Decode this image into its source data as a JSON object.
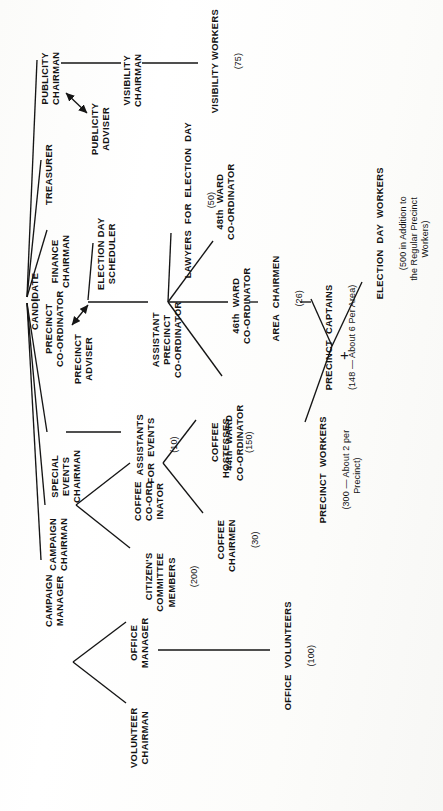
{
  "document": {
    "type": "organization-chart",
    "orientation": "rotated-90-ccw",
    "title": "Campaign Organization Chart",
    "ink_color": "#121212",
    "paper_color": "#fdfdfb"
  },
  "nodes": {
    "candidate": {
      "label": "CANDIDATE"
    },
    "campaign_manager": {
      "label": "CAMPAIGN\nMANAGER"
    },
    "campaign_chairman": {
      "label": "CAMPAIGN\nCHAIRMAN"
    },
    "special_events_chairman": {
      "label": "SPECIAL\nEVENTS\nCHAIRMAN"
    },
    "precinct_coordinator": {
      "label": "PRECINCT\nCO-ORDINATOR"
    },
    "finance_chairman": {
      "label": "FINANCE\nCHAIRMAN"
    },
    "treasurer": {
      "label": "TREASURER"
    },
    "publicity_chairman": {
      "label": "PUBLICITY\nCHAIRMAN"
    },
    "publicity_adviser": {
      "label": "PUBLICITY\nADVISER"
    },
    "visibility_chairman": {
      "label": "VISIBILITY\nCHAIRMAN"
    },
    "visibility_workers": {
      "label": "VISIBILITY WORKERS",
      "count": "(75)"
    },
    "election_day_scheduler": {
      "label": "ELECTION DAY\nSCHEDULER"
    },
    "precinct_adviser": {
      "label": "PRECINCT\nADVISER"
    },
    "assistant_precinct_coordinator": {
      "label": "ASSISTANT\nPRECINCT\nCO-ORDINATOR"
    },
    "lawyers_for_election_day": {
      "label": "LAWYERS  FOR  ELECTION  DAY",
      "count": "(50)"
    },
    "ward_48": {
      "label": "48th  WARD\nCO-ORDINATOR"
    },
    "ward_46": {
      "label": "46th  WARD\nCO-ORDINATOR"
    },
    "ward_44": {
      "label": "44th  WARD\nCO-ORDINATOR"
    },
    "area_chairmen": {
      "label": "AREA  CHAIRMEN",
      "count": "(26)"
    },
    "precinct_captains": {
      "label": "PRECINCT  CAPTAINS",
      "count": "(148 — About 6 Per Area)"
    },
    "precinct_workers": {
      "label": "PRECINCT  WORKERS",
      "count": "(300 — About 2 per\nPrecinct)"
    },
    "election_day_workers": {
      "label": "ELECTION  DAY  WORKERS",
      "count": "(500 in Addition to\nthe Regular Precinct\nWorkers)"
    },
    "assistants_for_events": {
      "label": "ASSISTANTS\nFOR  EVENTS",
      "count": "(10)"
    },
    "citizens_committee_members": {
      "label": "CITIZEN'S\nCOMMITTEE\nMEMBERS",
      "count": "(200)"
    },
    "coffee_coordinator": {
      "label": "COFFEE\nCO-ORD\nINATOR"
    },
    "coffee_chairmen": {
      "label": "COFFEE\nCHAIRMEN",
      "count": "(30)"
    },
    "coffee_hostesses": {
      "label": "COFFEE\nHOSTESSES",
      "count": "(150)"
    },
    "volunteer_chairman": {
      "label": "VOLUNTEER\nCHAIRMAN"
    },
    "office_manager": {
      "label": "OFFICE\nMANAGER"
    },
    "office_volunteers": {
      "label": "OFFICE  VOLUNTEERS",
      "count": "(100)"
    }
  },
  "symbols": {
    "plus": "+"
  },
  "edges": [
    {
      "from": "candidate",
      "to": "campaign_manager",
      "style": "line"
    },
    {
      "from": "candidate",
      "to": "campaign_chairman",
      "style": "line"
    },
    {
      "from": "candidate",
      "to": "special_events_chairman",
      "style": "line"
    },
    {
      "from": "candidate",
      "to": "precinct_coordinator",
      "style": "tick"
    },
    {
      "from": "candidate",
      "to": "finance_chairman",
      "style": "line"
    },
    {
      "from": "candidate",
      "to": "treasurer",
      "style": "line"
    },
    {
      "from": "candidate",
      "to": "publicity_chairman",
      "style": "line"
    },
    {
      "from": "publicity_chairman",
      "to": "publicity_adviser",
      "style": "double-arrow"
    },
    {
      "from": "publicity_chairman",
      "to": "visibility_chairman",
      "style": "line"
    },
    {
      "from": "visibility_chairman",
      "to": "visibility_workers",
      "style": "line"
    },
    {
      "from": "precinct_coordinator",
      "to": "election_day_scheduler",
      "style": "line"
    },
    {
      "from": "precinct_coordinator",
      "to": "precinct_adviser",
      "style": "double-arrow"
    },
    {
      "from": "precinct_coordinator",
      "to": "assistant_precinct_coordinator",
      "style": "line"
    },
    {
      "from": "assistant_precinct_coordinator",
      "to": "lawyers_for_election_day",
      "style": "line"
    },
    {
      "from": "assistant_precinct_coordinator",
      "to": "ward_48",
      "style": "line"
    },
    {
      "from": "assistant_precinct_coordinator",
      "to": "ward_46",
      "style": "line"
    },
    {
      "from": "assistant_precinct_coordinator",
      "to": "ward_44",
      "style": "line"
    },
    {
      "from": "ward_46",
      "to": "area_chairmen",
      "style": "tick"
    },
    {
      "from": "area_chairmen",
      "to": "precinct_captains",
      "style": "tick"
    },
    {
      "from": "precinct_captains",
      "to": "precinct_workers",
      "style": "line"
    },
    {
      "from": "precinct_captains",
      "to": "election_day_workers",
      "style": "line"
    },
    {
      "from": "special_events_chairman",
      "to": "assistants_for_events",
      "style": "line"
    },
    {
      "from": "campaign_chairman",
      "to": "citizens_committee_members",
      "style": "line"
    },
    {
      "from": "campaign_chairman",
      "to": "coffee_coordinator",
      "style": "line"
    },
    {
      "from": "coffee_coordinator",
      "to": "coffee_chairmen",
      "style": "line"
    },
    {
      "from": "coffee_coordinator",
      "to": "coffee_hostesses",
      "style": "line"
    },
    {
      "from": "campaign_manager",
      "to": "volunteer_chairman",
      "style": "line"
    },
    {
      "from": "campaign_manager",
      "to": "office_manager",
      "style": "line"
    },
    {
      "from": "office_manager",
      "to": "office_volunteers",
      "style": "line"
    }
  ]
}
